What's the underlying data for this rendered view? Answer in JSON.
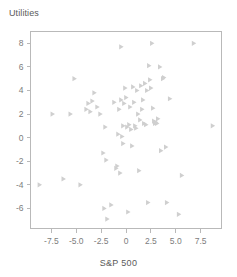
{
  "chart_data": {
    "type": "scatter",
    "title": "",
    "xlabel": "S&P 500",
    "ylabel": "Utilities",
    "xlim": [
      -9.6,
      9.6
    ],
    "ylim": [
      -7.7,
      9.0
    ],
    "xticks": [
      -7.5,
      -5.0,
      -2.5,
      0,
      2.5,
      5.0,
      7.5
    ],
    "xticklabels": [
      "-7.5",
      "-5.0",
      "-2.5",
      "0",
      "2.5",
      "5.0",
      "7.5"
    ],
    "yticks": [
      8,
      6,
      4,
      2,
      0,
      -2,
      -4,
      -6
    ],
    "yticklabels": [
      "8",
      "6",
      "4",
      "2",
      "0",
      "-2",
      "-4",
      "-6"
    ],
    "grid": false,
    "legend": null,
    "marker": "triangle-right",
    "marker_color": "#cfcfcf",
    "frame_color": "#b9b9b9",
    "text_color": "#5a5a5a",
    "tick_color": "#7d7d7d",
    "points": [
      [
        -8.7,
        -4.0
      ],
      [
        -7.4,
        2.0
      ],
      [
        -6.3,
        -3.5
      ],
      [
        -5.6,
        2.0
      ],
      [
        -5.2,
        5.0
      ],
      [
        -4.6,
        -4.0
      ],
      [
        -4.0,
        2.4
      ],
      [
        -3.8,
        2.9
      ],
      [
        -3.6,
        2.2
      ],
      [
        -3.4,
        3.1
      ],
      [
        -3.2,
        3.8
      ],
      [
        -2.9,
        2.6
      ],
      [
        -2.6,
        2.0
      ],
      [
        -2.3,
        -1.3
      ],
      [
        -2.2,
        -6.0
      ],
      [
        -2.1,
        0.9
      ],
      [
        -2.0,
        -1.9
      ],
      [
        -1.9,
        -6.9
      ],
      [
        -1.5,
        -5.7
      ],
      [
        -1.2,
        3.0
      ],
      [
        -1.0,
        -2.6
      ],
      [
        -0.9,
        -2.4
      ],
      [
        -0.8,
        0.3
      ],
      [
        -0.7,
        2.4
      ],
      [
        -0.6,
        -3.0
      ],
      [
        -0.5,
        7.7
      ],
      [
        -0.5,
        3.2
      ],
      [
        -0.4,
        0.1
      ],
      [
        -0.3,
        -0.5
      ],
      [
        -0.3,
        1.0
      ],
      [
        -0.2,
        2.9
      ],
      [
        -0.1,
        4.2
      ],
      [
        0.0,
        3.4
      ],
      [
        0.1,
        0.9
      ],
      [
        0.2,
        -6.3
      ],
      [
        0.3,
        1.1
      ],
      [
        0.4,
        2.6
      ],
      [
        0.5,
        0.7
      ],
      [
        0.6,
        -0.7
      ],
      [
        0.7,
        4.3
      ],
      [
        0.8,
        3.0
      ],
      [
        0.9,
        1.0
      ],
      [
        1.0,
        0.8
      ],
      [
        1.1,
        4.0
      ],
      [
        1.2,
        2.0
      ],
      [
        1.3,
        -2.8
      ],
      [
        1.4,
        1.5
      ],
      [
        1.5,
        4.4
      ],
      [
        1.6,
        2.4
      ],
      [
        1.7,
        3.2
      ],
      [
        1.8,
        1.2
      ],
      [
        1.9,
        4.6
      ],
      [
        2.0,
        1.1
      ],
      [
        2.1,
        4.0
      ],
      [
        2.2,
        -5.5
      ],
      [
        2.3,
        6.1
      ],
      [
        2.4,
        4.9
      ],
      [
        2.5,
        4.2
      ],
      [
        2.6,
        8.0
      ],
      [
        2.7,
        2.5
      ],
      [
        2.8,
        1.4
      ],
      [
        2.9,
        1.2
      ],
      [
        3.0,
        1.3
      ],
      [
        3.1,
        1.2
      ],
      [
        3.2,
        1.6
      ],
      [
        3.4,
        6.0
      ],
      [
        3.5,
        -1.1
      ],
      [
        3.7,
        5.0
      ],
      [
        3.8,
        5.1
      ],
      [
        4.0,
        -0.8
      ],
      [
        4.1,
        -5.5
      ],
      [
        4.4,
        3.3
      ],
      [
        5.3,
        -6.5
      ],
      [
        5.6,
        -3.2
      ],
      [
        6.8,
        8.0
      ],
      [
        8.7,
        1.0
      ]
    ]
  }
}
